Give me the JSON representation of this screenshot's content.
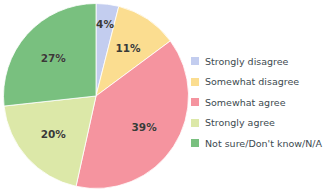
{
  "chart_data": {
    "type": "pie",
    "title": "",
    "subtitle": "",
    "xlabel": "",
    "ylabel": "",
    "grid": false,
    "legend_position": "right",
    "start_angle_deg": -90,
    "direction": "clockwise",
    "background_color": "#ffffff",
    "label_color": "#3a3a36",
    "categories": [
      "Strongly disagree",
      "Somewhat disagree",
      "Somewhat agree",
      "Strongly agree",
      "Not sure/Don't know/N/A"
    ],
    "values": [
      4,
      11,
      39,
      20,
      27
    ],
    "value_labels": [
      "4%",
      "11%",
      "39%",
      "20%",
      "27%"
    ],
    "colors": [
      "#c3cdef",
      "#fbdd90",
      "#f5949f",
      "#dce8a8",
      "#79c07f"
    ]
  },
  "legend": {
    "items": [
      {
        "label": "Strongly disagree",
        "color": "#c3cdef"
      },
      {
        "label": "Somewhat disagree",
        "color": "#fbdd90"
      },
      {
        "label": "Somewhat agree",
        "color": "#f5949f"
      },
      {
        "label": "Strongly agree",
        "color": "#dce8a8"
      },
      {
        "label": "Not sure/Don't know/N/A",
        "color": "#79c07f"
      }
    ]
  }
}
